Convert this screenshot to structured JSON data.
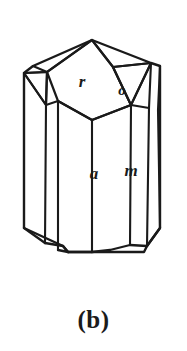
{
  "figure": {
    "kind": "crystal-habit-drawing",
    "caption": "(b)",
    "background_color": "#ffffff",
    "line_color": "#1a1a1a",
    "fill_color": "#ffffff",
    "face_labels": [
      {
        "id": "r",
        "text": "r",
        "x": 82,
        "y": 83,
        "font_size": 17
      },
      {
        "id": "o",
        "text": "o",
        "x": 122,
        "y": 92,
        "font_size": 15
      },
      {
        "id": "a",
        "text": "a",
        "x": 94,
        "y": 175,
        "font_size": 17
      },
      {
        "id": "m",
        "text": "m",
        "x": 131,
        "y": 172,
        "font_size": 17
      }
    ],
    "geometry": {
      "outline": "M 92,40 L 151,63 L 160,66 L 160,228 L 147,246 L 144,252 L 68,252 L 63,246 L 24,228 L 24,73 L 33,66 Z",
      "top_apex_left": "M 92,40 L 33,66 L 24,73",
      "top_apex_right": "M 92,40 L 151,63 L 160,66",
      "r_face": "M 92,40 L 113,67 L 131,105 L 92,120 L 58,101 L 47,72 Z",
      "o_face": "M 113,67 L 151,63 L 131,105 Z",
      "left_small_face": "M 24,73 L 47,72 L 46,105 Z",
      "edges": [
        "M 33,66 L 47,72",
        "M 24,73 L 47,72",
        "M 24,73 L 46,105",
        "M 47,72 L 46,105",
        "M 92,40 L 47,72",
        "M 92,40 L 113,67",
        "M 113,67 L 151,63",
        "M 113,67 L 131,105",
        "M 151,63 L 131,105",
        "M 151,63 L 149,108",
        "M 160,66 L 158,110",
        "M 58,101 L 46,105",
        "M 58,101 L 92,120",
        "M 92,120 L 131,105",
        "M 131,105 L 149,108",
        "M 46,105 L 45,243",
        "M 58,101 L 58,250",
        "M 92,120 L 92,252",
        "M 131,105 L 130,245",
        "M 149,108 L 147,246",
        "M 158,110 L 160,228"
      ],
      "bottom_edges": [
        "M 24,228 L 45,243",
        "M 45,243 L 63,246",
        "M 63,246 L 68,252",
        "M 68,252 L 92,252",
        "M 92,252 L 110,250",
        "M 110,250 L 130,245",
        "M 130,245 L 147,246",
        "M 147,246 L 160,228",
        "M 58,250 L 68,252"
      ]
    }
  }
}
